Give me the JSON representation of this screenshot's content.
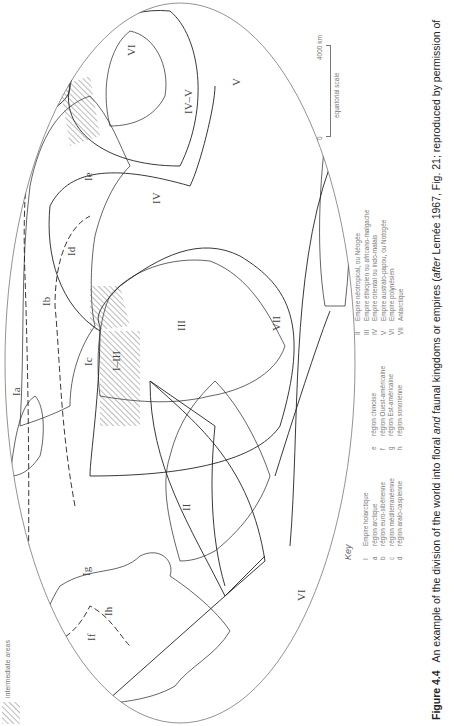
{
  "figure": {
    "number": "Figure 4.4",
    "caption_pre": "An example of the division of the world into floral ",
    "caption_and": "and",
    "caption_post": " faunal kingdoms or empires (",
    "caption_after": "after",
    "caption_tail": " Lemée 1967, Fig. 21; reproduced by permission of"
  },
  "legend": {
    "hatch_label": "intermediate areas"
  },
  "key": {
    "title": "Key",
    "col1": [
      {
        "code": "I",
        "label": "Empire holarctique"
      },
      {
        "code": "a",
        "label": "région arctique"
      },
      {
        "code": "b",
        "label": "région euro-sibérienne"
      },
      {
        "code": "c",
        "label": "région méditerranéenne"
      },
      {
        "code": "d",
        "label": "région aralo-caspienne"
      }
    ],
    "col2": [
      {
        "code": "e",
        "label": "région chinoise"
      },
      {
        "code": "f",
        "label": "région Ouest-américaine"
      },
      {
        "code": "g",
        "label": "région Est-américaine"
      },
      {
        "code": "h",
        "label": "région sonorienne"
      }
    ],
    "col3": [
      {
        "code": "II",
        "label": "Empire néotropical, ou Néogée"
      },
      {
        "code": "III",
        "label": "Empire éthiopien ou africano-malgache"
      },
      {
        "code": "IV",
        "label": "Empire oriental ou indo-malais"
      },
      {
        "code": "V",
        "label": "Empire australo-papou, ou Notogée"
      },
      {
        "code": "VI",
        "label": "Empire polynésien"
      },
      {
        "code": "VII",
        "label": "Antarctique"
      }
    ]
  },
  "scale": {
    "zero": "0",
    "max": "4000 km",
    "note": "equatorial scale"
  },
  "map": {
    "labels": {
      "VI_west": "VI",
      "VI_east": "VI",
      "If": "If",
      "Ih": "Ih",
      "Ig": "Ig",
      "II": "II",
      "Ia": "Ia",
      "Ib": "Ib",
      "Ic": "Ic",
      "Id": "Id",
      "Ie": "Ie",
      "I_III": "I–III",
      "III": "III",
      "IV": "IV",
      "IV_V": "IV–V",
      "V": "V",
      "VII": "VII"
    }
  }
}
